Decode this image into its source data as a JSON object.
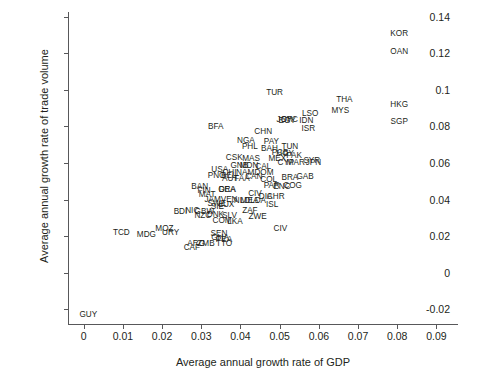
{
  "chart_data": {
    "type": "scatter",
    "title": "",
    "xlabel": "Average annual growth rate of GDP",
    "ylabel": "Average annual growth rate of trade volume",
    "xlim": [
      -0.004,
      0.0955
    ],
    "ylim": [
      -0.0285,
      0.1425
    ],
    "xticks": [
      "0",
      "0.01",
      "0.02",
      "0.03",
      "0.04",
      "0.05",
      "0.06",
      "0.07",
      "0.08",
      "0.09"
    ],
    "xtickvalues": [
      0,
      0.01,
      0.02,
      0.03,
      0.04,
      0.05,
      0.06,
      0.07,
      0.08,
      0.09
    ],
    "yticks": [
      "-0.02",
      "0",
      "0.02",
      "0.04",
      "0.06",
      "0.08",
      "0.1",
      "0.12",
      "0.14"
    ],
    "ytickvalues": [
      -0.02,
      0,
      0.02,
      0.04,
      0.06,
      0.08,
      0.1,
      0.12,
      0.14
    ],
    "grid": false,
    "legend": null,
    "marker_style": "text-label",
    "axis_color": "#58585a",
    "text_color": "#231f20",
    "points": [
      {
        "label": "KOR",
        "x": 0.0805,
        "y": 0.1305
      },
      {
        "label": "OAN",
        "x": 0.0805,
        "y": 0.1205
      },
      {
        "label": "HKG",
        "x": 0.0805,
        "y": 0.0915
      },
      {
        "label": "SGP",
        "x": 0.0805,
        "y": 0.0825
      },
      {
        "label": "THA",
        "x": 0.0665,
        "y": 0.0945
      },
      {
        "label": "MYS",
        "x": 0.0655,
        "y": 0.0885
      },
      {
        "label": "TUR",
        "x": 0.0487,
        "y": 0.0985
      },
      {
        "label": "LSO",
        "x": 0.0578,
        "y": 0.0868
      },
      {
        "label": "IDN",
        "x": 0.0568,
        "y": 0.0832
      },
      {
        "label": "ISR",
        "x": 0.0573,
        "y": 0.0785
      },
      {
        "label": "SYC",
        "x": 0.0525,
        "y": 0.0833
      },
      {
        "label": "JOR",
        "x": 0.0513,
        "y": 0.0833
      },
      {
        "label": "EGY",
        "x": 0.0519,
        "y": 0.083
      },
      {
        "label": "BFA",
        "x": 0.0337,
        "y": 0.0795
      },
      {
        "label": "CHN",
        "x": 0.0458,
        "y": 0.0768
      },
      {
        "label": "NGA",
        "x": 0.0414,
        "y": 0.0722
      },
      {
        "label": "PAY",
        "x": 0.0479,
        "y": 0.0715
      },
      {
        "label": "PHL",
        "x": 0.0424,
        "y": 0.0688
      },
      {
        "label": "TUN",
        "x": 0.0526,
        "y": 0.069
      },
      {
        "label": "BAH",
        "x": 0.0474,
        "y": 0.0678
      },
      {
        "label": "PCB",
        "x": 0.0501,
        "y": 0.0655
      },
      {
        "label": "HGY",
        "x": 0.0514,
        "y": 0.065
      },
      {
        "label": "PAK",
        "x": 0.0537,
        "y": 0.0638
      },
      {
        "label": "MEX",
        "x": 0.0494,
        "y": 0.0622
      },
      {
        "label": "CYP",
        "x": 0.0516,
        "y": 0.06
      },
      {
        "label": "MAR",
        "x": 0.0541,
        "y": 0.06
      },
      {
        "label": "SYR",
        "x": 0.0582,
        "y": 0.0612
      },
      {
        "label": "JPN",
        "x": 0.0586,
        "y": 0.0598
      },
      {
        "label": "CSK",
        "x": 0.0384,
        "y": 0.0625
      },
      {
        "label": "MAS",
        "x": 0.0427,
        "y": 0.062
      },
      {
        "label": "GNB",
        "x": 0.0397,
        "y": 0.0585
      },
      {
        "label": "MDN",
        "x": 0.0422,
        "y": 0.0585
      },
      {
        "label": "CAL",
        "x": 0.0458,
        "y": 0.0578
      },
      {
        "label": "USA",
        "x": 0.0347,
        "y": 0.0562
      },
      {
        "label": "CHI",
        "x": 0.0372,
        "y": 0.0546
      },
      {
        "label": "NAM",
        "x": 0.0412,
        "y": 0.0548
      },
      {
        "label": "BEL",
        "x": 0.037,
        "y": 0.0528
      },
      {
        "label": "DOM",
        "x": 0.046,
        "y": 0.0548
      },
      {
        "label": "PNG",
        "x": 0.0339,
        "y": 0.0528
      },
      {
        "label": "CAN",
        "x": 0.0434,
        "y": 0.0522
      },
      {
        "label": "COL",
        "x": 0.0472,
        "y": 0.0508
      },
      {
        "label": "BRA",
        "x": 0.0526,
        "y": 0.052
      },
      {
        "label": "GAB",
        "x": 0.0565,
        "y": 0.0522
      },
      {
        "label": "AUT",
        "x": 0.0374,
        "y": 0.0512
      },
      {
        "label": "FAA",
        "x": 0.0404,
        "y": 0.0512
      },
      {
        "label": "PAR",
        "x": 0.048,
        "y": 0.0472
      },
      {
        "label": "ENC",
        "x": 0.0506,
        "y": 0.047
      },
      {
        "label": "COG",
        "x": 0.0533,
        "y": 0.0472
      },
      {
        "label": "BAN",
        "x": 0.0296,
        "y": 0.0468
      },
      {
        "label": "FIN",
        "x": 0.0307,
        "y": 0.0448
      },
      {
        "label": "GRA",
        "x": 0.0366,
        "y": 0.0455
      },
      {
        "label": "DEA",
        "x": 0.0366,
        "y": 0.0452
      },
      {
        "label": "MAT",
        "x": 0.0315,
        "y": 0.0425
      },
      {
        "label": "CIV",
        "x": 0.0437,
        "y": 0.0428
      },
      {
        "label": "DIA",
        "x": 0.0464,
        "y": 0.0412
      },
      {
        "label": "CHR",
        "x": 0.049,
        "y": 0.0412
      },
      {
        "label": "JAM",
        "x": 0.0329,
        "y": 0.0398
      },
      {
        "label": "VEN",
        "x": 0.0371,
        "y": 0.0398
      },
      {
        "label": "NLD",
        "x": 0.0404,
        "y": 0.0395
      },
      {
        "label": "MEA",
        "x": 0.0423,
        "y": 0.0392
      },
      {
        "label": "LDA",
        "x": 0.0445,
        "y": 0.039
      },
      {
        "label": "ISL",
        "x": 0.0481,
        "y": 0.037
      },
      {
        "label": "SWE",
        "x": 0.034,
        "y": 0.0375
      },
      {
        "label": "LUX",
        "x": 0.0364,
        "y": 0.0372
      },
      {
        "label": "SIE",
        "x": 0.0341,
        "y": 0.0358
      },
      {
        "label": "BDI",
        "x": 0.0247,
        "y": 0.0332
      },
      {
        "label": "NIC",
        "x": 0.0277,
        "y": 0.034
      },
      {
        "label": "GBW",
        "x": 0.0308,
        "y": 0.0335
      },
      {
        "label": "ZAF",
        "x": 0.0424,
        "y": 0.034
      },
      {
        "label": "NZC",
        "x": 0.0304,
        "y": 0.0312
      },
      {
        "label": "DNK",
        "x": 0.0336,
        "y": 0.0315
      },
      {
        "label": "SLV",
        "x": 0.0372,
        "y": 0.0312
      },
      {
        "label": "ZWE",
        "x": 0.0444,
        "y": 0.0305
      },
      {
        "label": "COM",
        "x": 0.0353,
        "y": 0.0282
      },
      {
        "label": "LKA",
        "x": 0.0386,
        "y": 0.0278
      },
      {
        "label": "CIV",
        "x": 0.0502,
        "y": 0.0242
      },
      {
        "label": "MOZ",
        "x": 0.0206,
        "y": 0.024
      },
      {
        "label": "URY",
        "x": 0.0222,
        "y": 0.0218
      },
      {
        "label": "TCD",
        "x": 0.0096,
        "y": 0.0216
      },
      {
        "label": "MDG",
        "x": 0.016,
        "y": 0.0205
      },
      {
        "label": "SEN",
        "x": 0.0345,
        "y": 0.0212
      },
      {
        "label": "GHA",
        "x": 0.0348,
        "y": 0.0192
      },
      {
        "label": "PEA",
        "x": 0.0358,
        "y": 0.0178
      },
      {
        "label": "ARG",
        "x": 0.0287,
        "y": 0.0155
      },
      {
        "label": "ZMB",
        "x": 0.0312,
        "y": 0.0155
      },
      {
        "label": "TTO",
        "x": 0.0358,
        "y": 0.0158
      },
      {
        "label": "CAF",
        "x": 0.0276,
        "y": 0.0135
      },
      {
        "label": "GUY",
        "x": 0.0012,
        "y": -0.0233
      }
    ]
  }
}
